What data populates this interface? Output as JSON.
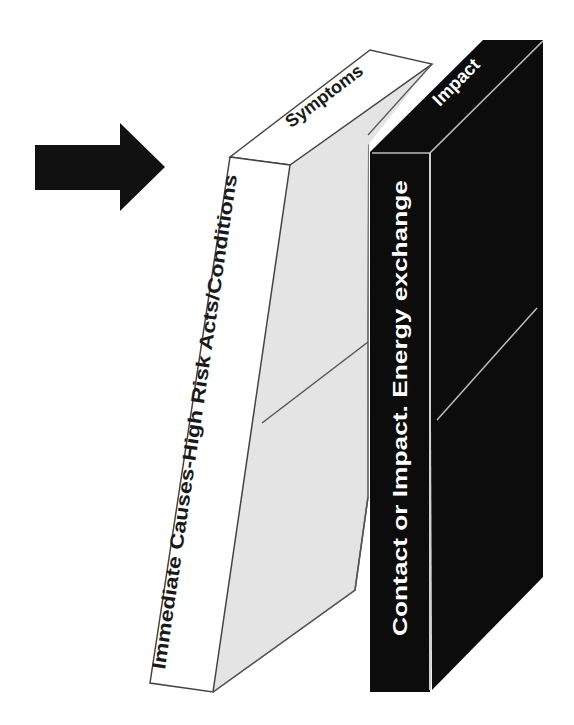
{
  "diagram": {
    "arrow": {
      "icon": "right-arrow-icon",
      "color": "#111111"
    },
    "white_block": {
      "spine_label": "Immediate Causes-High Risk Acts/Conditions",
      "top_label": "Symptoms",
      "front_color": "#ffffff",
      "side_color": "#e6e6e6",
      "outline_color": "#444444"
    },
    "black_block": {
      "spine_label": "Contact or Impact. Energy exchange",
      "top_label": "Impact",
      "fill_color": "#0c0c0c",
      "text_color": "#ffffff",
      "edge_color": "#bdbdbd"
    }
  }
}
